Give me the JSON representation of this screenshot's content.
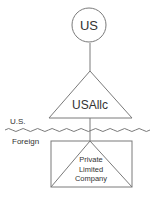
{
  "diagram": {
    "type": "entity-structure",
    "colors": {
      "stroke": "#7a7a7a",
      "text": "#333333",
      "background": "#ffffff"
    },
    "nodes": {
      "parent": {
        "shape": "circle",
        "label": "US"
      },
      "llc": {
        "shape": "triangle",
        "label": "USAllc"
      },
      "subsidiary": {
        "shape": "rectangle-with-triangle",
        "label_lines": [
          "Private",
          "Limited",
          "Company"
        ]
      }
    },
    "border": {
      "style": "wavy-line",
      "label_above": "U.S.",
      "label_below": "Foreign"
    },
    "edges": [
      {
        "from": "parent",
        "to": "llc"
      },
      {
        "from": "llc",
        "to": "subsidiary"
      }
    ]
  }
}
